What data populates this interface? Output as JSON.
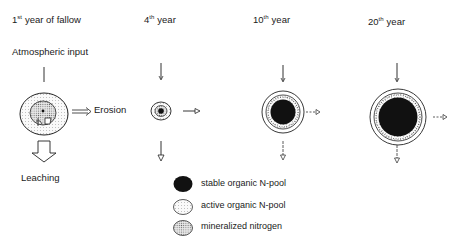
{
  "stages": [
    {
      "num": "1",
      "suffix": "st",
      "rest": "year of fallow"
    },
    {
      "num": "4",
      "suffix": "th",
      "rest": "year"
    },
    {
      "num": "10",
      "suffix": "th",
      "rest": "year"
    },
    {
      "num": "20",
      "suffix": "th",
      "rest": "year"
    }
  ],
  "labels": {
    "atmospheric_input": "Atmospheric input",
    "erosion": "Erosion",
    "leaching": "Leaching"
  },
  "legend": [
    {
      "key": "stable",
      "label": "stable organic N-pool",
      "color": "#111111"
    },
    {
      "key": "active",
      "label": "active organic N-pool",
      "color": "#f2f2f2"
    },
    {
      "key": "mineral",
      "label": "mineralized nitrogen",
      "color": "#cfcfcf"
    }
  ]
}
